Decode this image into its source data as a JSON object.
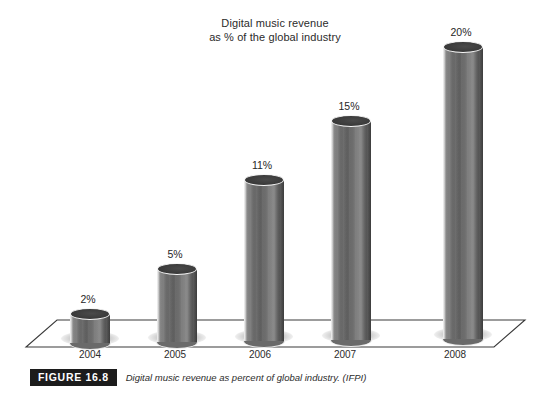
{
  "chart_data": {
    "type": "bar",
    "title": "Digital music revenue as % of the global industry",
    "title_lines": [
      "Digital music revenue",
      "as % of the global industry"
    ],
    "categories": [
      "2004",
      "2005",
      "2006",
      "2007",
      "2008"
    ],
    "values": [
      2,
      5,
      11,
      15,
      20
    ],
    "value_labels": [
      "2%",
      "5%",
      "11%",
      "15%",
      "20%"
    ],
    "xlabel": "",
    "ylabel": "",
    "ylim": [
      0,
      20
    ],
    "unit": "%",
    "grid": false,
    "legend": null,
    "style": "3d-cylinder",
    "bar_color": "#6a6a6a"
  },
  "caption": {
    "badge": "FIGURE 16.8",
    "text": "Digital music revenue as percent of global industry. (IFPI)"
  }
}
